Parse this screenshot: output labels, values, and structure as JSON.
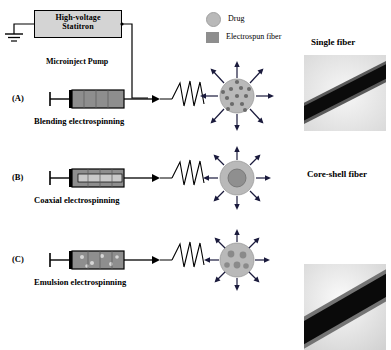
{
  "figure": {
    "power_supply": {
      "line1": "High-voltage",
      "line2": "Statitron"
    },
    "pump_label": "Microinject Pump",
    "legend": [
      {
        "name": "drug",
        "label": "Drug",
        "color": "#b9b9b9",
        "shape": "circle"
      },
      {
        "name": "electrospun-fiber",
        "label": "Electrospun fiber",
        "color": "#8e8e8e",
        "shape": "rect"
      }
    ],
    "rows": [
      {
        "tag": "(A)",
        "caption": "Blending electrospinning"
      },
      {
        "tag": "(B)",
        "caption": "Coaxial electrospinning"
      },
      {
        "tag": "(C)",
        "caption": "Emulsion electrospinning"
      }
    ],
    "micrographs": [
      {
        "title": "Single fiber",
        "name": "single-fiber-micrograph"
      },
      {
        "title": "Core-shell fiber",
        "name": "core-shell-fiber-micrograph"
      }
    ],
    "colors": {
      "syringe_body": "#8e8e8e",
      "particle": "#b9b9b9",
      "box_fill": "#d4d4d4",
      "stroke": "#000000"
    }
  }
}
